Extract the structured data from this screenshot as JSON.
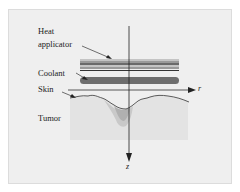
{
  "labels": {
    "heat_line1": "Heat",
    "heat_line2": "applicator",
    "coolant": "Coolant",
    "skin": "Skin",
    "tumor": "Tumor"
  },
  "axes": {
    "r": "r",
    "z": "z"
  },
  "colors": {
    "panel_bg": "#efefef",
    "tissue": "#e3e3e3",
    "tumor_outer": "#c9c9c9",
    "tumor_inner": "#b0b0b0",
    "coolant": "#6e6e6e",
    "applicator_dark": "#6a6a6a",
    "applicator_mid": "#9a9a9a",
    "applicator_light": "#c4c4c4",
    "line": "#222222"
  }
}
